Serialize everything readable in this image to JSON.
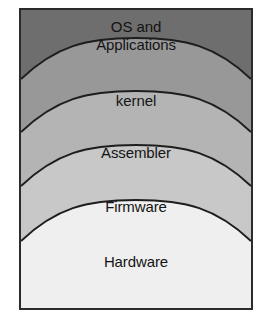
{
  "figure": {
    "type": "layered-stack-diagram",
    "title": "",
    "frame": {
      "border_color": "#2b2b2b",
      "background_color": "#ffffff"
    },
    "orientation": "top-to-bottom, highest abstraction at top"
  },
  "layers": [
    {
      "id": "os-and-applications",
      "label": "OS and\nApplications",
      "level": 5,
      "fill_color": "#6e6e6e",
      "text_color": "#141414"
    },
    {
      "id": "kernel",
      "label": "kernel",
      "level": 4,
      "fill_color": "#989898",
      "text_color": "#141414"
    },
    {
      "id": "assembler",
      "label": "Assembler",
      "level": 3,
      "fill_color": "#b4b4b4",
      "text_color": "#141414"
    },
    {
      "id": "firmware",
      "label": "Firmware",
      "level": 2,
      "fill_color": "#c8c8c8",
      "text_color": "#141414"
    },
    {
      "id": "hardware",
      "label": "Hardware",
      "level": 1,
      "fill_color": "#efefef",
      "text_color": "#141414"
    }
  ],
  "divider": {
    "stroke_color": "#1e1e1e",
    "stroke_width": 2,
    "shape": "upward-arching-curve"
  }
}
